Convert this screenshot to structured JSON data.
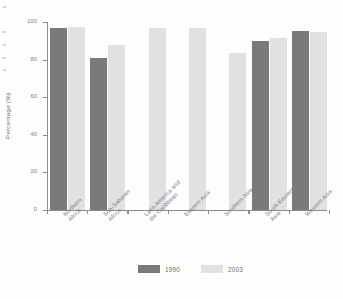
{
  "chart_data": {
    "type": "bar",
    "title": "",
    "subtitle": "",
    "xlabel": "",
    "ylabel": "Percentage (%)",
    "ylim": [
      0,
      100
    ],
    "yticks": [
      0,
      20,
      40,
      60,
      80,
      100
    ],
    "grid": false,
    "legend_position": "bottom",
    "categories": [
      "Northern Africa",
      "Sub-Saharan Africa",
      "Latin America and the Caribbean",
      "Eastern Asia",
      "Southern Asia",
      "South-Eastern Asia",
      "Western Asia"
    ],
    "category_lines": [
      [
        "Northern",
        "Africa"
      ],
      [
        "Sub-Saharan",
        "Africa"
      ],
      [
        "Latin America and",
        "the Caribbean"
      ],
      [
        "Eastern Asia"
      ],
      [
        "Southern Asia"
      ],
      [
        "South-Eastern",
        "Asia"
      ],
      [
        "Western Asia"
      ]
    ],
    "series": [
      {
        "name": "1990",
        "color": "#7a7a7a",
        "values": [
          97,
          81,
          null,
          null,
          null,
          90,
          95
        ]
      },
      {
        "name": "2003",
        "color": "#e1e1e1",
        "values": [
          97.5,
          88,
          97,
          97,
          83.5,
          91.5,
          94.5
        ]
      }
    ]
  },
  "axis": {
    "y_title": "Percentage (%)",
    "tick_labels": [
      "100",
      "80",
      "60",
      "40",
      "20",
      "0"
    ]
  },
  "legend": {
    "items": [
      {
        "label": "1990",
        "swatch": "dark-gray-swatch"
      },
      {
        "label": "2003",
        "swatch": "light-gray-swatch"
      }
    ]
  }
}
